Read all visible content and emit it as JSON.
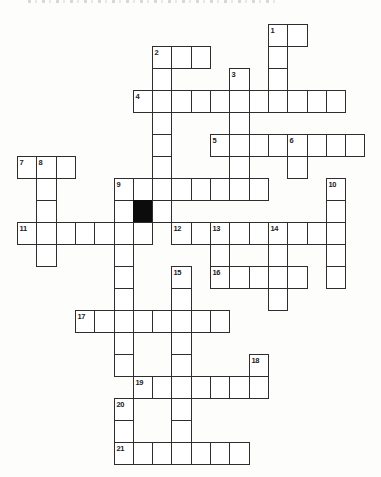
{
  "puzzle": {
    "kind": "freeform-crossword",
    "grid_columns": 18,
    "grid_rows": 20,
    "black_cell_color": "#0c0c0c",
    "line_color": "#2e2e2e",
    "clue_numbers_visible": [
      "1",
      "2",
      "3",
      "4",
      "5",
      "6",
      "7",
      "8",
      "9",
      "10",
      "11",
      "12",
      "13",
      "14",
      "15",
      "16",
      "17",
      "18",
      "19",
      "20",
      "21"
    ],
    "cells": [
      {
        "c": 13,
        "r": 0,
        "n": "1"
      },
      {
        "c": 14,
        "r": 0
      },
      {
        "c": 7,
        "r": 1,
        "n": "2"
      },
      {
        "c": 8,
        "r": 1
      },
      {
        "c": 9,
        "r": 1
      },
      {
        "c": 13,
        "r": 1
      },
      {
        "c": 7,
        "r": 2
      },
      {
        "c": 11,
        "r": 2,
        "n": "3"
      },
      {
        "c": 13,
        "r": 2
      },
      {
        "c": 6,
        "r": 3,
        "n": "4"
      },
      {
        "c": 7,
        "r": 3
      },
      {
        "c": 8,
        "r": 3
      },
      {
        "c": 9,
        "r": 3
      },
      {
        "c": 10,
        "r": 3
      },
      {
        "c": 11,
        "r": 3
      },
      {
        "c": 12,
        "r": 3
      },
      {
        "c": 13,
        "r": 3
      },
      {
        "c": 14,
        "r": 3
      },
      {
        "c": 15,
        "r": 3
      },
      {
        "c": 16,
        "r": 3
      },
      {
        "c": 7,
        "r": 4
      },
      {
        "c": 11,
        "r": 4
      },
      {
        "c": 7,
        "r": 5
      },
      {
        "c": 10,
        "r": 5,
        "n": "5"
      },
      {
        "c": 11,
        "r": 5
      },
      {
        "c": 12,
        "r": 5
      },
      {
        "c": 13,
        "r": 5
      },
      {
        "c": 14,
        "r": 5,
        "n": "6"
      },
      {
        "c": 15,
        "r": 5
      },
      {
        "c": 16,
        "r": 5
      },
      {
        "c": 17,
        "r": 5
      },
      {
        "c": 0,
        "r": 6,
        "n": "7"
      },
      {
        "c": 1,
        "r": 6,
        "n": "8"
      },
      {
        "c": 2,
        "r": 6
      },
      {
        "c": 7,
        "r": 6
      },
      {
        "c": 11,
        "r": 6
      },
      {
        "c": 14,
        "r": 6
      },
      {
        "c": 1,
        "r": 7
      },
      {
        "c": 5,
        "r": 7,
        "n": "9"
      },
      {
        "c": 6,
        "r": 7
      },
      {
        "c": 7,
        "r": 7
      },
      {
        "c": 8,
        "r": 7
      },
      {
        "c": 9,
        "r": 7
      },
      {
        "c": 10,
        "r": 7
      },
      {
        "c": 11,
        "r": 7
      },
      {
        "c": 12,
        "r": 7
      },
      {
        "c": 16,
        "r": 7,
        "n": "10"
      },
      {
        "c": 1,
        "r": 8
      },
      {
        "c": 5,
        "r": 8
      },
      {
        "c": 6,
        "r": 8,
        "black": true
      },
      {
        "c": 7,
        "r": 8
      },
      {
        "c": 16,
        "r": 8
      },
      {
        "c": 0,
        "r": 9,
        "n": "11"
      },
      {
        "c": 1,
        "r": 9
      },
      {
        "c": 2,
        "r": 9
      },
      {
        "c": 3,
        "r": 9
      },
      {
        "c": 4,
        "r": 9
      },
      {
        "c": 5,
        "r": 9
      },
      {
        "c": 6,
        "r": 9
      },
      {
        "c": 8,
        "r": 9,
        "n": "12"
      },
      {
        "c": 9,
        "r": 9
      },
      {
        "c": 10,
        "r": 9,
        "n": "13"
      },
      {
        "c": 11,
        "r": 9
      },
      {
        "c": 12,
        "r": 9
      },
      {
        "c": 13,
        "r": 9,
        "n": "14"
      },
      {
        "c": 14,
        "r": 9
      },
      {
        "c": 15,
        "r": 9
      },
      {
        "c": 16,
        "r": 9
      },
      {
        "c": 1,
        "r": 10
      },
      {
        "c": 5,
        "r": 10
      },
      {
        "c": 10,
        "r": 10
      },
      {
        "c": 13,
        "r": 10
      },
      {
        "c": 16,
        "r": 10
      },
      {
        "c": 5,
        "r": 11
      },
      {
        "c": 8,
        "r": 11,
        "n": "15"
      },
      {
        "c": 10,
        "r": 11,
        "n": "16"
      },
      {
        "c": 11,
        "r": 11
      },
      {
        "c": 12,
        "r": 11
      },
      {
        "c": 13,
        "r": 11
      },
      {
        "c": 14,
        "r": 11
      },
      {
        "c": 16,
        "r": 11
      },
      {
        "c": 5,
        "r": 12
      },
      {
        "c": 8,
        "r": 12
      },
      {
        "c": 13,
        "r": 12
      },
      {
        "c": 3,
        "r": 13,
        "n": "17"
      },
      {
        "c": 4,
        "r": 13
      },
      {
        "c": 5,
        "r": 13
      },
      {
        "c": 6,
        "r": 13
      },
      {
        "c": 7,
        "r": 13
      },
      {
        "c": 8,
        "r": 13
      },
      {
        "c": 9,
        "r": 13
      },
      {
        "c": 10,
        "r": 13
      },
      {
        "c": 5,
        "r": 14
      },
      {
        "c": 8,
        "r": 14
      },
      {
        "c": 5,
        "r": 15
      },
      {
        "c": 8,
        "r": 15
      },
      {
        "c": 12,
        "r": 15,
        "n": "18"
      },
      {
        "c": 6,
        "r": 16,
        "n": "19"
      },
      {
        "c": 7,
        "r": 16
      },
      {
        "c": 8,
        "r": 16
      },
      {
        "c": 9,
        "r": 16
      },
      {
        "c": 10,
        "r": 16
      },
      {
        "c": 11,
        "r": 16
      },
      {
        "c": 12,
        "r": 16
      },
      {
        "c": 5,
        "r": 17,
        "n": "20"
      },
      {
        "c": 8,
        "r": 17
      },
      {
        "c": 5,
        "r": 18
      },
      {
        "c": 8,
        "r": 18
      },
      {
        "c": 5,
        "r": 19,
        "n": "21"
      },
      {
        "c": 6,
        "r": 19
      },
      {
        "c": 7,
        "r": 19
      },
      {
        "c": 8,
        "r": 19
      },
      {
        "c": 9,
        "r": 19
      },
      {
        "c": 10,
        "r": 19
      },
      {
        "c": 11,
        "r": 19
      }
    ]
  }
}
